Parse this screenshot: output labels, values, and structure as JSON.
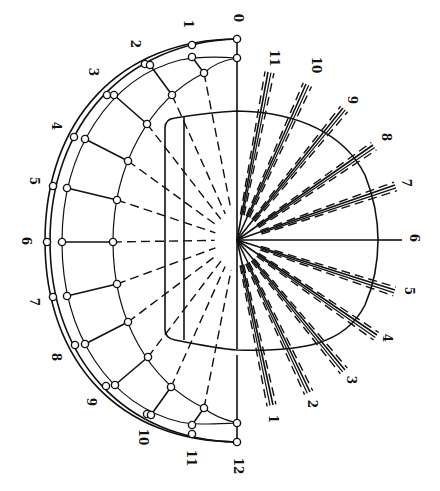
{
  "diagram": {
    "title": "",
    "center": [
      237,
      240
    ],
    "left_labels": [
      {
        "text": "0",
        "x": 237,
        "y": 18
      },
      {
        "text": "1",
        "x": 187,
        "y": 24
      },
      {
        "text": "2",
        "x": 134,
        "y": 44
      },
      {
        "text": "3",
        "x": 92,
        "y": 72
      },
      {
        "text": "4",
        "x": 55,
        "y": 126
      },
      {
        "text": "5",
        "x": 33,
        "y": 181
      },
      {
        "text": "6",
        "x": 25,
        "y": 241
      },
      {
        "text": "7",
        "x": 33,
        "y": 302
      },
      {
        "text": "8",
        "x": 55,
        "y": 357
      },
      {
        "text": "9",
        "x": 90,
        "y": 402
      },
      {
        "text": "10",
        "x": 142,
        "y": 437
      },
      {
        "text": "11",
        "x": 190,
        "y": 458
      },
      {
        "text": "12",
        "x": 237,
        "y": 466
      }
    ],
    "right_labels": [
      {
        "text": "11",
        "x": 273,
        "y": 58
      },
      {
        "text": "10",
        "x": 315,
        "y": 65
      },
      {
        "text": "9",
        "x": 351,
        "y": 100
      },
      {
        "text": "8",
        "x": 385,
        "y": 137
      },
      {
        "text": "7",
        "x": 405,
        "y": 183
      },
      {
        "text": "6",
        "x": 413,
        "y": 238
      },
      {
        "text": "5",
        "x": 408,
        "y": 291
      },
      {
        "text": "4",
        "x": 386,
        "y": 338
      },
      {
        "text": "3",
        "x": 350,
        "y": 380
      },
      {
        "text": "2",
        "x": 311,
        "y": 404
      },
      {
        "text": "1",
        "x": 272,
        "y": 419
      }
    ],
    "stations": [
      {
        "id": "0",
        "outer": [
          237,
          39
        ],
        "mid": [
          237,
          58
        ],
        "inner": null
      },
      {
        "id": "1",
        "outer": [
          192,
          45
        ],
        "mid": [
          192,
          57
        ],
        "inner": [
          204,
          73
        ]
      },
      {
        "id": "2",
        "outer": [
          145,
          64
        ],
        "mid": [
          150,
          65
        ],
        "inner": [
          172,
          95
        ]
      },
      {
        "id": "3",
        "outer": [
          107,
          95
        ],
        "mid": [
          114,
          95
        ],
        "inner": [
          147,
          124
        ]
      },
      {
        "id": "4",
        "outer": [
          74,
          137
        ],
        "mid": [
          85,
          139
        ],
        "inner": [
          128,
          161
        ]
      },
      {
        "id": "5",
        "outer": [
          53,
          186
        ],
        "mid": [
          67,
          188
        ],
        "inner": [
          117,
          200
        ]
      },
      {
        "id": "6",
        "outer": [
          47,
          242
        ],
        "mid": [
          62,
          242
        ],
        "inner": [
          113,
          242
        ]
      },
      {
        "id": "7",
        "outer": [
          53,
          297
        ],
        "mid": [
          67,
          296
        ],
        "inner": [
          117,
          284
        ]
      },
      {
        "id": "8",
        "outer": [
          75,
          345
        ],
        "mid": [
          85,
          344
        ],
        "inner": [
          128,
          322
        ]
      },
      {
        "id": "9",
        "outer": [
          106,
          386
        ],
        "mid": [
          115,
          385
        ],
        "inner": [
          148,
          357
        ]
      },
      {
        "id": "10",
        "outer": [
          147,
          414
        ],
        "mid": [
          151,
          415
        ],
        "inner": [
          171,
          387
        ]
      },
      {
        "id": "11",
        "outer": [
          192,
          434
        ],
        "mid": [
          192,
          425
        ],
        "inner": [
          204,
          408
        ]
      },
      {
        "id": "12",
        "outer": [
          237,
          442
        ],
        "mid": [
          237,
          423
        ],
        "inner": null
      }
    ],
    "fan_lines": [
      {
        "id": "11",
        "end": [
          268,
          72
        ]
      },
      {
        "id": "10",
        "end": [
          306,
          84
        ]
      },
      {
        "id": "9",
        "end": [
          343,
          108
        ]
      },
      {
        "id": "8",
        "end": [
          373,
          145
        ]
      },
      {
        "id": "7",
        "end": [
          395,
          185
        ]
      },
      {
        "id": "6",
        "end": [
          400,
          240
        ]
      },
      {
        "id": "5",
        "end": [
          395,
          290
        ]
      },
      {
        "id": "4",
        "end": [
          377,
          335
        ]
      },
      {
        "id": "3",
        "end": [
          345,
          370
        ]
      },
      {
        "id": "2",
        "end": [
          310,
          392
        ]
      },
      {
        "id": "1",
        "end": [
          273,
          405
        ]
      }
    ]
  }
}
